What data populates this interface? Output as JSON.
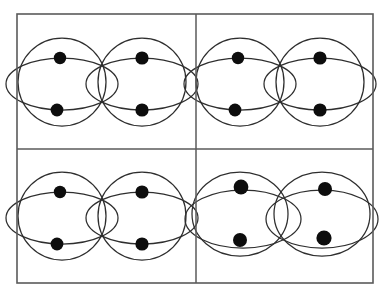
{
  "figure": {
    "canvas": {
      "width": 390,
      "height": 295
    },
    "colors": {
      "background": "#ffffff",
      "frame_stroke": "#5a5a5a",
      "curve_stroke": "#2e2e2e",
      "dot_fill": "#0d0d0d"
    },
    "frame": {
      "x": 17,
      "y": 14,
      "width": 356,
      "height": 269,
      "stroke_width": 1.6
    },
    "dividers": [
      {
        "name": "vertical-divider",
        "x1": 196,
        "y1": 14,
        "x2": 196,
        "y2": 283
      },
      {
        "name": "horizontal-divider",
        "x1": 17,
        "y1": 149,
        "x2": 373,
        "y2": 149
      }
    ],
    "panels": [
      {
        "name": "panel-top-left",
        "label": "a",
        "shape_kind": "circle",
        "curves": [
          {
            "type": "circle",
            "cx": 62,
            "cy": 82,
            "rx": 44,
            "ry": 44
          },
          {
            "type": "circle",
            "cx": 142,
            "cy": 82,
            "rx": 44,
            "ry": 44
          },
          {
            "type": "ellipse",
            "cx": 62,
            "cy": 84,
            "rx": 56,
            "ry": 26
          },
          {
            "type": "ellipse",
            "cx": 142,
            "cy": 84,
            "rx": 56,
            "ry": 26
          }
        ],
        "dots": [
          {
            "cx": 60,
            "cy": 58,
            "r": 6.2
          },
          {
            "cx": 142,
            "cy": 58,
            "r": 6.6
          },
          {
            "cx": 57,
            "cy": 110,
            "r": 6.4
          },
          {
            "cx": 142,
            "cy": 110,
            "r": 6.6
          }
        ]
      },
      {
        "name": "panel-top-right",
        "label": "b",
        "shape_kind": "circle",
        "curves": [
          {
            "type": "circle",
            "cx": 240,
            "cy": 82,
            "rx": 44,
            "ry": 44
          },
          {
            "type": "circle",
            "cx": 320,
            "cy": 82,
            "rx": 44,
            "ry": 44
          },
          {
            "type": "ellipse",
            "cx": 240,
            "cy": 84,
            "rx": 56,
            "ry": 26
          },
          {
            "type": "ellipse",
            "cx": 320,
            "cy": 84,
            "rx": 56,
            "ry": 26
          }
        ],
        "dots": [
          {
            "cx": 238,
            "cy": 58,
            "r": 6.2
          },
          {
            "cx": 320,
            "cy": 58,
            "r": 6.6
          },
          {
            "cx": 235,
            "cy": 110,
            "r": 6.4
          },
          {
            "cx": 320,
            "cy": 110,
            "r": 6.6
          }
        ]
      },
      {
        "name": "panel-bottom-left",
        "label": "c",
        "shape_kind": "circle",
        "curves": [
          {
            "type": "circle",
            "cx": 62,
            "cy": 216,
            "rx": 44,
            "ry": 44
          },
          {
            "type": "circle",
            "cx": 142,
            "cy": 216,
            "rx": 44,
            "ry": 44
          },
          {
            "type": "ellipse",
            "cx": 62,
            "cy": 218,
            "rx": 56,
            "ry": 26
          },
          {
            "type": "ellipse",
            "cx": 142,
            "cy": 218,
            "rx": 56,
            "ry": 26
          }
        ],
        "dots": [
          {
            "cx": 60,
            "cy": 192,
            "r": 6.2
          },
          {
            "cx": 142,
            "cy": 192,
            "r": 6.6
          },
          {
            "cx": 57,
            "cy": 244,
            "r": 6.4
          },
          {
            "cx": 142,
            "cy": 244,
            "r": 6.6
          }
        ]
      },
      {
        "name": "panel-bottom-right",
        "label": "d",
        "shape_kind": "ellipse",
        "curves": [
          {
            "type": "ellipse",
            "cx": 240,
            "cy": 214,
            "rx": 48,
            "ry": 42
          },
          {
            "type": "ellipse",
            "cx": 322,
            "cy": 214,
            "rx": 48,
            "ry": 42
          },
          {
            "type": "ellipse",
            "cx": 243,
            "cy": 219,
            "rx": 58,
            "ry": 29
          },
          {
            "type": "ellipse",
            "cx": 322,
            "cy": 219,
            "rx": 56,
            "ry": 29
          }
        ],
        "dots": [
          {
            "cx": 241,
            "cy": 187,
            "r": 7.4
          },
          {
            "cx": 325,
            "cy": 189,
            "r": 7.0
          },
          {
            "cx": 240,
            "cy": 240,
            "r": 7.0
          },
          {
            "cx": 324,
            "cy": 238,
            "r": 7.6
          }
        ]
      }
    ]
  }
}
